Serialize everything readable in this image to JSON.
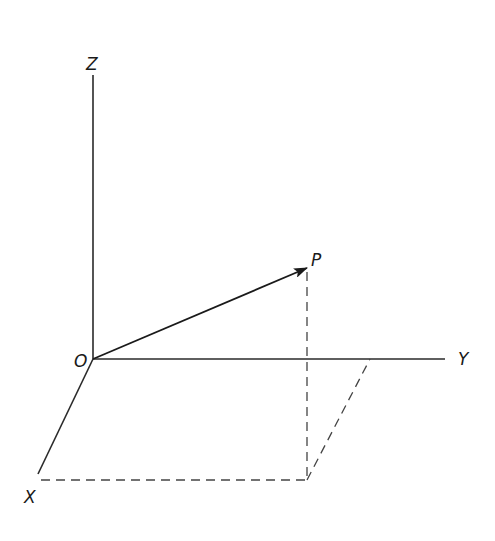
{
  "diagram": {
    "type": "3d-coordinate-axes",
    "labels": {
      "z_axis": "Z",
      "y_axis": "Y",
      "x_axis": "X",
      "origin": "O",
      "point": "P"
    },
    "points": {
      "origin": [
        93,
        359
      ],
      "z_end": [
        93,
        75
      ],
      "y_end": [
        445,
        359
      ],
      "x_end": [
        35,
        478
      ],
      "p": [
        307,
        268
      ],
      "p_projection_xy": [
        307,
        480
      ],
      "x_component": [
        41,
        480
      ],
      "y_component": [
        370,
        359
      ]
    },
    "colors": {
      "line": "#2a2a2a",
      "background": "#ffffff"
    }
  }
}
